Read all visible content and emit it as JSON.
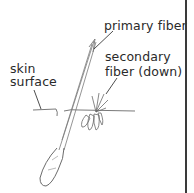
{
  "diagram": {
    "labels": {
      "primary": "primary fiber",
      "secondary_line1": "secondary",
      "secondary_line2": "fiber (down)",
      "skin_line1": "skin",
      "skin_line2": "surface"
    },
    "colors": {
      "ink": "#2a2a2a",
      "sketch": "#6a6a6a",
      "background": "#ffffff"
    }
  }
}
